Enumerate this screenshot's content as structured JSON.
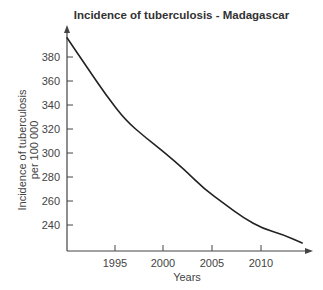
{
  "chart_data": {
    "type": "line",
    "title": "Incidence of tuberculosis - Madagascar",
    "xlabel": "Years",
    "ylabel_line1": "Incidence of tuberculosis",
    "ylabel_line2": "per 100 000",
    "ylabel": "Incidence of tuberculosis per 100 000",
    "x_ticks": [
      "1995",
      "2000",
      "2005",
      "2010"
    ],
    "y_ticks": [
      "240",
      "260",
      "280",
      "300",
      "320",
      "340",
      "360",
      "380"
    ],
    "xlim": [
      1990,
      2015
    ],
    "ylim": [
      222,
      400
    ],
    "grid": false,
    "legend": null,
    "series": [
      {
        "name": "Incidence of tuberculosis",
        "x": [
          1990,
          1992,
          1994,
          1996,
          1998,
          2000,
          2002,
          2004,
          2006,
          2008,
          2010,
          2012,
          2014
        ],
        "values": [
          396,
          372,
          348,
          327,
          313,
          300,
          286,
          270,
          258,
          246,
          237,
          232,
          225
        ]
      }
    ],
    "line_color": "#222222"
  }
}
